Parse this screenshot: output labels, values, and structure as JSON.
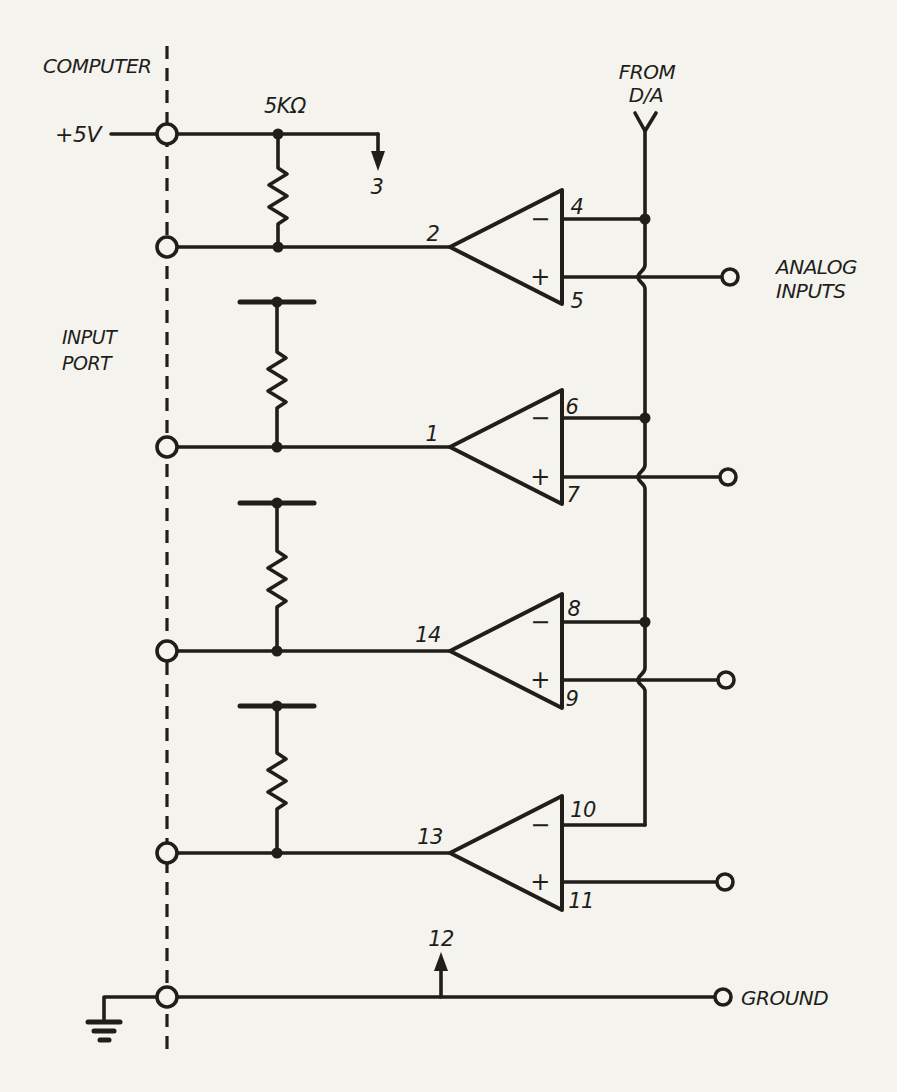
{
  "colors": {
    "paper": "#f5f3ee",
    "ink": "#211e1a"
  },
  "labels": {
    "computer": "COMPUTER",
    "input_port": [
      "INPUT",
      "PORT"
    ],
    "supply": "+5V",
    "resistor_value": "5KΩ",
    "from_da": [
      "FROM",
      "D/A"
    ],
    "analog_inputs": [
      "ANALOG",
      "INPUTS"
    ],
    "ground": "GROUND",
    "supply_tap_pin": "3",
    "ground_tap_pin": "12"
  },
  "symbols": {
    "minus": "−",
    "plus": "+"
  },
  "comparators": [
    {
      "output_pin": "2",
      "inverting_pin": "4",
      "noninverting_pin": "5"
    },
    {
      "output_pin": "1",
      "inverting_pin": "6",
      "noninverting_pin": "7"
    },
    {
      "output_pin": "14",
      "inverting_pin": "8",
      "noninverting_pin": "9"
    },
    {
      "output_pin": "13",
      "inverting_pin": "10",
      "noninverting_pin": "11"
    }
  ]
}
